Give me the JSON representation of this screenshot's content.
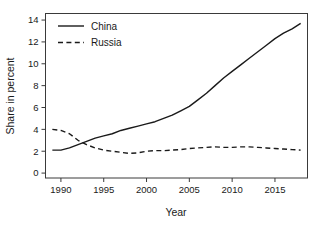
{
  "chart_data": {
    "type": "line",
    "title": "",
    "xlabel": "Year",
    "ylabel": "Share in percent",
    "xlim": [
      1988.2,
      2018.8
    ],
    "ylim": [
      -0.45,
      14.6
    ],
    "xticks": [
      1990,
      1995,
      2000,
      2005,
      2010,
      2015
    ],
    "xtick_labels": [
      "1990",
      "1995",
      "2000",
      "2005",
      "2010",
      "2015"
    ],
    "yticks": [
      0,
      2,
      4,
      6,
      8,
      10,
      12,
      14
    ],
    "ytick_labels": [
      "0",
      "2",
      "4",
      "6",
      "8",
      "10",
      "12",
      "14"
    ],
    "grid": false,
    "legend_position": "top-left",
    "x": [
      1989,
      1990,
      1991,
      1992,
      1993,
      1994,
      1995,
      1996,
      1997,
      1998,
      1999,
      2000,
      2001,
      2002,
      2003,
      2004,
      2005,
      2006,
      2007,
      2008,
      2009,
      2010,
      2011,
      2012,
      2013,
      2014,
      2015,
      2016,
      2017,
      2018
    ],
    "series": [
      {
        "name": "China",
        "style": "solid",
        "color": "#1a1a1a",
        "values": [
          2.1,
          2.1,
          2.3,
          2.6,
          2.9,
          3.2,
          3.4,
          3.6,
          3.9,
          4.1,
          4.3,
          4.5,
          4.7,
          5.0,
          5.3,
          5.7,
          6.1,
          6.7,
          7.3,
          8.0,
          8.7,
          9.3,
          9.9,
          10.5,
          11.1,
          11.7,
          12.3,
          12.8,
          13.2,
          13.7
        ]
      },
      {
        "name": "Russia",
        "style": "dashed",
        "color": "#1a1a1a",
        "values": [
          4.0,
          3.9,
          3.6,
          3.0,
          2.6,
          2.3,
          2.1,
          2.0,
          1.9,
          1.8,
          1.85,
          2.0,
          2.05,
          2.05,
          2.1,
          2.15,
          2.25,
          2.3,
          2.35,
          2.4,
          2.35,
          2.35,
          2.4,
          2.4,
          2.35,
          2.3,
          2.25,
          2.2,
          2.15,
          2.1
        ]
      }
    ],
    "legend": [
      {
        "label": "China",
        "style": "solid"
      },
      {
        "label": "Russia",
        "style": "dashed"
      }
    ]
  }
}
